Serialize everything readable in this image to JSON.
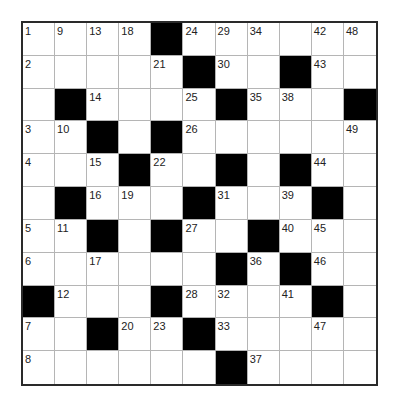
{
  "puzzle": {
    "rows": 11,
    "cols": 11,
    "colors": {
      "block": "#000000",
      "cell": "#ffffff",
      "gridline": "#b5b5b5",
      "border": "#2a2a2a"
    },
    "grid": [
      [
        "1",
        "9",
        "13",
        "18",
        "#",
        "24",
        "29",
        "34",
        "",
        "42",
        "48"
      ],
      [
        "2",
        "",
        "",
        "",
        "21",
        "#",
        "30",
        "",
        "#",
        "43",
        ""
      ],
      [
        "",
        "#",
        "14",
        "",
        "",
        "25",
        "#",
        "35",
        "38",
        "",
        "#"
      ],
      [
        "3",
        "10",
        "#",
        "",
        "#",
        "26",
        "",
        "",
        "",
        "",
        "49"
      ],
      [
        "4",
        "",
        "15",
        "#",
        "22",
        "",
        "#",
        "",
        "#",
        "44",
        ""
      ],
      [
        "",
        "#",
        "16",
        "19",
        "",
        "#",
        "31",
        "",
        "39",
        "#",
        ""
      ],
      [
        "5",
        "11",
        "#",
        "",
        "#",
        "27",
        "",
        "#",
        "40",
        "45",
        ""
      ],
      [
        "6",
        "",
        "17",
        "",
        "",
        "",
        "#",
        "36",
        "#",
        "46",
        ""
      ],
      [
        "#",
        "12",
        "",
        "",
        "#",
        "28",
        "32",
        "",
        "41",
        "#",
        ""
      ],
      [
        "7",
        "",
        "#",
        "20",
        "23",
        "#",
        "33",
        "",
        "",
        "47",
        ""
      ],
      [
        "8",
        "",
        "",
        "",
        "",
        "",
        "#",
        "37",
        "",
        "",
        ""
      ]
    ]
  }
}
